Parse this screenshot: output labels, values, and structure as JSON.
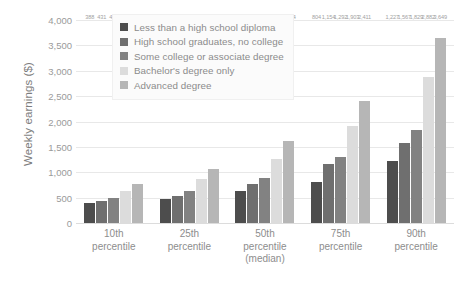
{
  "chart_data": {
    "type": "bar",
    "title": "",
    "subtitle": "",
    "xlabel": "",
    "ylabel": "Weekly earnings ($)",
    "ylim": [
      0,
      4000
    ],
    "ytick_labels": [
      "4,000",
      "3,500",
      "3,000",
      "2,500",
      "2,000",
      "1,500",
      "1,000",
      "500",
      "0"
    ],
    "ytick_values": [
      4000,
      3500,
      3000,
      2500,
      2000,
      1500,
      1000,
      500,
      0
    ],
    "grid": true,
    "legend_position": "upper-left-inside",
    "categories": [
      "10th percentile",
      "25th percentile",
      "50th percentile (median)",
      "75th percentile",
      "90th percentile"
    ],
    "category_lines": [
      [
        "10th",
        "percentile"
      ],
      [
        "25th",
        "percentile"
      ],
      [
        "50th",
        "percentile",
        "(median)"
      ],
      [
        "75th",
        "percentile"
      ],
      [
        "90th",
        "percentile"
      ]
    ],
    "series": [
      {
        "name": "Less than a high school diploma",
        "color": "#4d4d4d",
        "values": [
          388,
          476,
          626,
          804,
          1227
        ],
        "labels": [
          "388",
          "476",
          "626",
          "804",
          "1,227"
        ]
      },
      {
        "name": "High school graduates, no college",
        "color": "#6f6f6f",
        "values": [
          431,
          527,
          766,
          1154,
          1567
        ],
        "labels": [
          "431",
          "527",
          "766",
          "1,154",
          "1,567"
        ]
      },
      {
        "name": "Some college or associate degree",
        "color": "#828282",
        "values": [
          484,
          622,
          880,
          1292,
          1829
        ],
        "labels": [
          "484",
          "622",
          "880",
          "1,292",
          "1,829"
        ]
      },
      {
        "name": "Bachelor's degree only",
        "color": "#dcdcdc",
        "values": [
          629,
          877,
          1260,
          1903,
          2882
        ],
        "labels": [
          "629",
          "877",
          "1,260",
          "1,903",
          "2,882"
        ]
      },
      {
        "name": "Advanced degree",
        "color": "#b6b6b6",
        "values": [
          761,
          1068,
          1614,
          2411,
          3649
        ],
        "labels": [
          "761",
          "1,068",
          "1,614",
          "2,411",
          "3,649"
        ]
      }
    ]
  }
}
